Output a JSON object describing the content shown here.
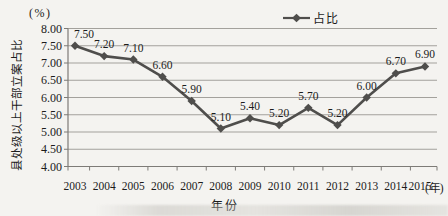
{
  "chart_data": {
    "type": "line",
    "title": "",
    "categories": [
      "2003",
      "2004",
      "2005",
      "2006",
      "2007",
      "2008",
      "2009",
      "2010",
      "2011",
      "2012",
      "2013",
      "2014",
      "2015"
    ],
    "series": [
      {
        "name": "占比",
        "values": [
          7.5,
          7.2,
          7.1,
          6.6,
          5.9,
          5.1,
          5.4,
          5.2,
          5.7,
          5.2,
          6.0,
          6.7,
          6.9
        ]
      }
    ],
    "data_labels": [
      "7.50",
      "7.20",
      "7.10",
      "6.60",
      "5.90",
      "5.10",
      "5.40",
      "5.20",
      "5.70",
      "5.20",
      "6.00",
      "6.70",
      "6.90"
    ],
    "ylim": [
      4.0,
      8.0
    ],
    "ytick_step": 0.5,
    "ytick_labels": [
      "8.00",
      "7.50",
      "7.00",
      "6.50",
      "6.00",
      "5.50",
      "5.00",
      "4.50",
      "4.00"
    ],
    "ylabel": "县处级以上干部立案占比",
    "y_axis_unit": "(%)",
    "xlabel": "年份",
    "x_axis_unit": "(年)",
    "grid": true,
    "legend": {
      "label": "占比",
      "position": "top-center"
    }
  },
  "colors": {
    "line": "#4f4e4c",
    "marker": "#4f4e4c",
    "grid": "#a3a19c",
    "axis": "#7d7b77",
    "text": "#1c1c1c",
    "background": "#f4f3f0"
  }
}
